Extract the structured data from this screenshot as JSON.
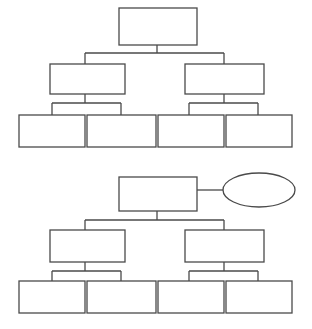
{
  "figure": {
    "diagrams": [
      {
        "id": "tree-1",
        "nodes": [
          {
            "id": "root",
            "shape": "rectangle",
            "label": ""
          },
          {
            "id": "mid-left",
            "shape": "rectangle",
            "label": "",
            "parent": "root"
          },
          {
            "id": "mid-right",
            "shape": "rectangle",
            "label": "",
            "parent": "root"
          },
          {
            "id": "leaf-1",
            "shape": "rectangle",
            "label": "",
            "parent": "mid-left"
          },
          {
            "id": "leaf-2",
            "shape": "rectangle",
            "label": "",
            "parent": "mid-left"
          },
          {
            "id": "leaf-3",
            "shape": "rectangle",
            "label": "",
            "parent": "mid-right"
          },
          {
            "id": "leaf-4",
            "shape": "rectangle",
            "label": "",
            "parent": "mid-right"
          }
        ]
      },
      {
        "id": "tree-2",
        "nodes": [
          {
            "id": "root",
            "shape": "rectangle",
            "label": ""
          },
          {
            "id": "side-oval",
            "shape": "ellipse",
            "label": "",
            "attached_to": "root"
          },
          {
            "id": "mid-left",
            "shape": "rectangle",
            "label": "",
            "parent": "root"
          },
          {
            "id": "mid-right",
            "shape": "rectangle",
            "label": "",
            "parent": "root"
          },
          {
            "id": "leaf-1",
            "shape": "rectangle",
            "label": "",
            "parent": "mid-left"
          },
          {
            "id": "leaf-2",
            "shape": "rectangle",
            "label": "",
            "parent": "mid-left"
          },
          {
            "id": "leaf-3",
            "shape": "rectangle",
            "label": "",
            "parent": "mid-right"
          },
          {
            "id": "leaf-4",
            "shape": "rectangle",
            "label": "",
            "parent": "mid-right"
          }
        ]
      }
    ],
    "colors": {
      "stroke": "#4a4a4a",
      "background": "#ffffff"
    }
  }
}
